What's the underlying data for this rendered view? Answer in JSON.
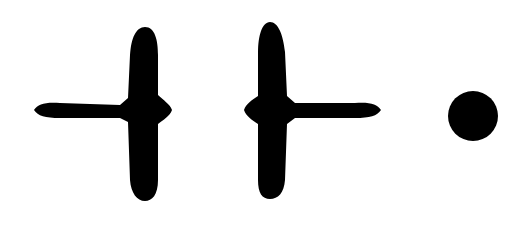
{
  "canvas": {
    "width": 524,
    "height": 229,
    "background": "#ffffff"
  },
  "shapes": [
    {
      "name": "left-tee-shape",
      "color": "#000000"
    },
    {
      "name": "right-tee-shape",
      "color": "#000000"
    },
    {
      "name": "dot-shape",
      "color": "#000000"
    }
  ]
}
